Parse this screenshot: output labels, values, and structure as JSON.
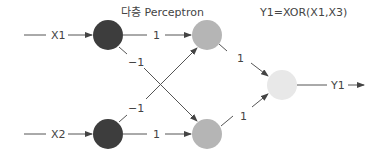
{
  "diagram": {
    "title_left": "다층 Perceptron",
    "title_right": "Y1=XOR(X1,X3)",
    "inputs": [
      {
        "label": "X1"
      },
      {
        "label": "X2"
      }
    ],
    "weights": {
      "x1_h1": "1",
      "x1_h2": "−1",
      "x2_h1": "−1",
      "x2_h2": "1",
      "h1_out": "1",
      "h2_out": "1"
    },
    "output": {
      "label": "Y1"
    },
    "colors": {
      "input_node": "#3d3d3d",
      "hidden_node": "#b5b5b5",
      "output_node": "#e8e8e8",
      "line": "#555555"
    }
  }
}
